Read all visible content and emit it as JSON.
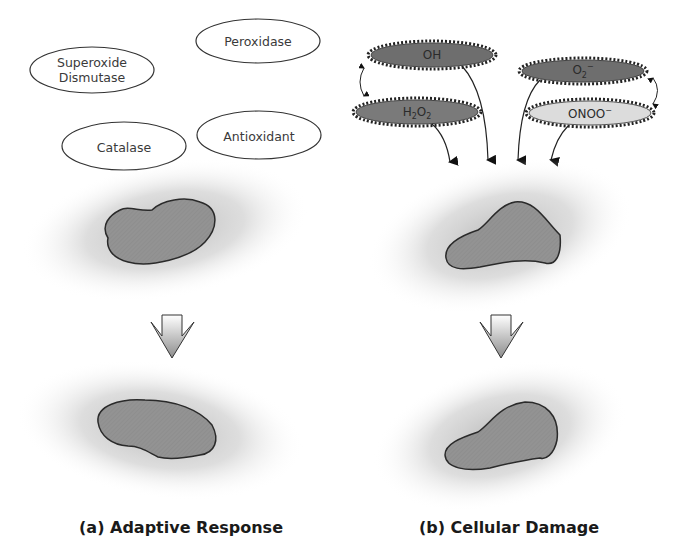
{
  "panels": {
    "a": {
      "caption": "(a) Adaptive Response",
      "enzymes": [
        {
          "id": "sod",
          "line1": "Superoxide",
          "line2": "Dismutase"
        },
        {
          "id": "peroxidase",
          "label": "Peroxidase"
        },
        {
          "id": "catalase",
          "label": "Catalase"
        },
        {
          "id": "antioxidant",
          "label": "Antioxidant"
        }
      ]
    },
    "b": {
      "caption": "(b) Cellular Damage",
      "species": [
        {
          "id": "oh",
          "base": "OH",
          "sub1": "",
          "base2": "",
          "sub2": "",
          "sup": "",
          "fill": "#6e6e6e"
        },
        {
          "id": "h2o2",
          "base": "H",
          "sub1": "2",
          "base2": "O",
          "sub2": "2",
          "sup": "",
          "fill": "#7a7a7a"
        },
        {
          "id": "o2",
          "base": "O",
          "sub1": "2",
          "base2": "",
          "sub2": "",
          "sup": "−",
          "fill": "#6e6e6e"
        },
        {
          "id": "onoo",
          "base": "ONOO",
          "sub1": "",
          "base2": "",
          "sub2": "",
          "sup": "−",
          "fill": "#d9d9d9"
        }
      ]
    }
  },
  "colors": {
    "cell_fill": "#8f8f8f",
    "cell_stroke": "#2a2a2a",
    "halo": "#bdbdbd",
    "arrow": "#111111",
    "enzyme_stroke": "#333333"
  }
}
